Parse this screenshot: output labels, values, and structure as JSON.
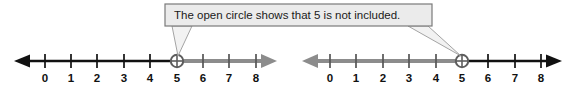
{
  "callout": {
    "text": "The open circle shows that 5 is not included.",
    "box_fill": "#ebebeb",
    "box_border": "#7a7a7a",
    "text_color": "#1a1a1a"
  },
  "colors": {
    "black_line": "#111111",
    "gray_line": "#8c8c8c",
    "tick": "#111111",
    "circle_stroke": "#6b6b6b",
    "background": "#ffffff"
  },
  "number_lines": [
    {
      "id": "left",
      "labels": [
        "0",
        "1",
        "2",
        "3",
        "4",
        "5",
        "6",
        "7",
        "8"
      ],
      "open_circle_at": "5",
      "left_segment_color": "black",
      "right_segment_color": "gray",
      "left_arrow": true,
      "right_arrow": true,
      "meaning": "x is less than 5"
    },
    {
      "id": "right",
      "labels": [
        "0",
        "1",
        "2",
        "3",
        "4",
        "5",
        "6",
        "7",
        "8"
      ],
      "open_circle_at": "5",
      "left_segment_color": "gray",
      "right_segment_color": "black",
      "left_arrow": true,
      "right_arrow": true,
      "meaning": "x is greater than 5"
    }
  ]
}
